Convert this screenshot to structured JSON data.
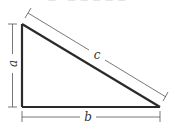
{
  "figure": {
    "top_cropped_text": "— · — — — — —",
    "colors": {
      "triangle_stroke": "#2a2a2a",
      "dimension_stroke": "#555555",
      "label": "#333333",
      "background": "#ffffff"
    }
  },
  "triangle": {
    "vertices": {
      "top_left": [
        22,
        24
      ],
      "bottom_left": [
        22,
        107
      ],
      "bottom_right": [
        160,
        107
      ]
    },
    "sides": [
      {
        "name": "a",
        "role": "vertical leg"
      },
      {
        "name": "b",
        "role": "horizontal leg"
      },
      {
        "name": "c",
        "role": "hypotenuse"
      }
    ]
  },
  "labels": {
    "a": "a",
    "b": "b",
    "c": "c"
  }
}
